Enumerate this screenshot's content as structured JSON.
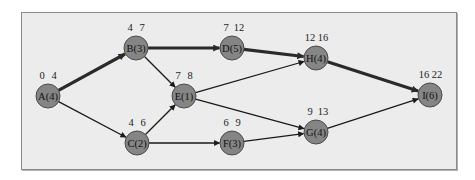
{
  "diagram": {
    "type": "activity-on-node network (critical path)",
    "colors": {
      "background": "#ececec",
      "frame_border": "#8a8a8a",
      "node_fill": "#858585",
      "node_stroke": "#4a4a4a",
      "edge": "#1a1a1a",
      "critical_edge": "#2a2a2a"
    },
    "nodes": [
      {
        "id": "A",
        "label": "A(4)",
        "es": "0",
        "ef": "4",
        "x": 48,
        "y": 96
      },
      {
        "id": "B",
        "label": "B(3)",
        "es": "4",
        "ef": "7",
        "x": 136,
        "y": 48
      },
      {
        "id": "C",
        "label": "C(2)",
        "es": "4",
        "ef": "6",
        "x": 137,
        "y": 143
      },
      {
        "id": "D",
        "label": "D(5)",
        "es": "7",
        "ef": "12",
        "x": 232,
        "y": 48
      },
      {
        "id": "E",
        "label": "E(1)",
        "es": "7",
        "ef": "8",
        "x": 184,
        "y": 96
      },
      {
        "id": "F",
        "label": "F(3)",
        "es": "6",
        "ef": "9",
        "x": 232,
        "y": 143
      },
      {
        "id": "G",
        "label": "G(4)",
        "es": "9",
        "ef": "13",
        "x": 316,
        "y": 132
      },
      {
        "id": "H",
        "label": "H(4)",
        "es": "12",
        "ef": "16",
        "x": 316,
        "y": 58
      },
      {
        "id": "I",
        "label": "I(6)",
        "es": "16",
        "ef": "22",
        "x": 430,
        "y": 95
      }
    ],
    "edges": [
      {
        "from": "A",
        "to": "B",
        "critical": true
      },
      {
        "from": "A",
        "to": "C",
        "critical": false
      },
      {
        "from": "B",
        "to": "D",
        "critical": true
      },
      {
        "from": "B",
        "to": "E",
        "critical": false
      },
      {
        "from": "C",
        "to": "E",
        "critical": false
      },
      {
        "from": "C",
        "to": "F",
        "critical": false
      },
      {
        "from": "D",
        "to": "H",
        "critical": true
      },
      {
        "from": "E",
        "to": "H",
        "critical": false
      },
      {
        "from": "E",
        "to": "G",
        "critical": false
      },
      {
        "from": "F",
        "to": "G",
        "critical": false
      },
      {
        "from": "H",
        "to": "I",
        "critical": true
      },
      {
        "from": "G",
        "to": "I",
        "critical": false
      }
    ]
  }
}
